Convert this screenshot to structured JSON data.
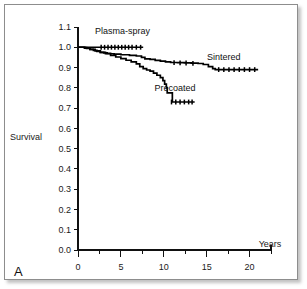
{
  "figure": {
    "panel_letter": "A",
    "background_color": "#ffffff",
    "frame_color": "#8d8d8d",
    "curve_color": "#000000"
  },
  "chart_data": {
    "type": "line",
    "title": "",
    "subtitle": "",
    "xlabel": "Years",
    "ylabel": "Survival",
    "xlim": [
      0,
      22.5
    ],
    "ylim": [
      0.0,
      1.1
    ],
    "grid": false,
    "legend_position": "inline-annotations",
    "x_major_ticks": [
      0,
      5,
      10,
      15,
      20
    ],
    "x_minor_ticks": [
      2.5,
      7.5,
      12.5,
      17.5,
      22.5
    ],
    "x_tick_labels": [
      "0",
      "5",
      "10",
      "15",
      "20"
    ],
    "y_ticks": [
      0.0,
      0.1,
      0.2,
      0.3,
      0.4,
      0.5,
      0.6,
      0.7,
      0.8,
      0.9,
      1.0,
      1.1
    ],
    "y_tick_labels": [
      "0.0",
      "0.1",
      "0.2",
      "0.3",
      "0.4",
      "0.5",
      "0.6",
      "0.7",
      "0.8",
      "0.9",
      "1.0",
      "1.1"
    ],
    "series": [
      {
        "name": "Plasma-spray",
        "label": "Plasma-spray",
        "label_x": 5.2,
        "label_y": 1.065,
        "x": [
          0.0,
          1.0,
          2.0,
          2.6,
          3.2,
          4.0,
          5.0,
          6.0,
          7.0,
          7.6
        ],
        "y": [
          1.0,
          1.0,
          1.0,
          1.0,
          1.0,
          1.0,
          1.0,
          1.0,
          1.0,
          1.0
        ],
        "censor_x": [
          2.7,
          3.1,
          3.5,
          3.9,
          4.3,
          4.7,
          5.1,
          5.5,
          5.9,
          6.3,
          6.8,
          7.3
        ],
        "censor_y": [
          1.0,
          1.0,
          1.0,
          1.0,
          1.0,
          1.0,
          1.0,
          1.0,
          1.0,
          1.0,
          1.0,
          1.0
        ]
      },
      {
        "name": "Sintered",
        "label": "Sintered",
        "label_x": 17.0,
        "label_y": 0.935,
        "x": [
          0.0,
          0.7,
          1.0,
          1.4,
          1.8,
          2.2,
          2.6,
          3.0,
          3.4,
          3.8,
          4.2,
          5.0,
          6.0,
          6.8,
          7.4,
          7.8,
          8.4,
          9.0,
          9.6,
          10.2,
          10.8,
          11.6,
          12.4,
          13.2,
          14.0,
          14.6,
          15.2,
          15.7,
          16.0,
          17.0,
          18.5,
          20.0,
          21.0
        ],
        "y": [
          1.0,
          0.998,
          0.995,
          0.99,
          0.985,
          0.98,
          0.975,
          0.972,
          0.97,
          0.968,
          0.966,
          0.963,
          0.96,
          0.957,
          0.95,
          0.943,
          0.94,
          0.935,
          0.932,
          0.928,
          0.925,
          0.924,
          0.923,
          0.922,
          0.92,
          0.915,
          0.905,
          0.895,
          0.89,
          0.89,
          0.89,
          0.89,
          0.89
        ],
        "censor_x": [
          11.2,
          11.9,
          12.6,
          13.4,
          16.4,
          17.0,
          17.6,
          18.2,
          18.8,
          19.4,
          20.0,
          20.6
        ],
        "censor_y": [
          0.9245,
          0.9235,
          0.9225,
          0.921,
          0.89,
          0.89,
          0.89,
          0.89,
          0.89,
          0.89,
          0.89,
          0.89
        ]
      },
      {
        "name": "Precoated",
        "label": "Precoated",
        "label_x": 11.3,
        "label_y": 0.785,
        "x": [
          0.0,
          0.8,
          1.4,
          2.0,
          2.6,
          3.2,
          3.8,
          4.4,
          5.0,
          5.6,
          6.2,
          6.8,
          7.2,
          7.6,
          8.0,
          8.4,
          8.8,
          9.2,
          9.6,
          9.9,
          10.1,
          10.3,
          10.4,
          11.0,
          12.0,
          13.0,
          13.6
        ],
        "y": [
          1.0,
          0.996,
          0.99,
          0.982,
          0.975,
          0.968,
          0.96,
          0.952,
          0.944,
          0.936,
          0.928,
          0.918,
          0.905,
          0.895,
          0.888,
          0.882,
          0.872,
          0.862,
          0.85,
          0.835,
          0.818,
          0.8,
          0.775,
          0.73,
          0.73,
          0.73,
          0.73
        ],
        "censor_x": [
          10.9,
          11.4,
          11.9,
          12.4,
          12.9,
          13.3
        ],
        "censor_y": [
          0.73,
          0.73,
          0.73,
          0.73,
          0.73,
          0.73
        ]
      }
    ]
  }
}
